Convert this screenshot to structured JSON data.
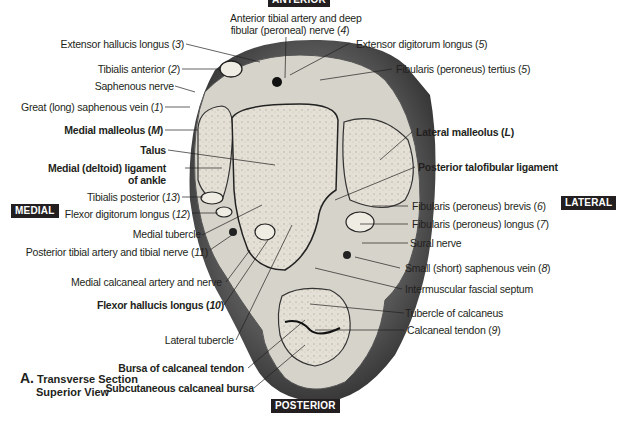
{
  "figure": {
    "caption_letter": "A.",
    "caption_line1": "Transverse Section",
    "caption_line2": "Superior View"
  },
  "orientation_tags": {
    "top": "ANTERIOR",
    "left": "MEDIAL",
    "right": "LATERAL",
    "bottom": "POSTERIOR"
  },
  "labels_left": [
    {
      "text": "Extensor hallucis longus",
      "num": "3",
      "bold": false
    },
    {
      "text": "Tibialis anterior",
      "num": "2",
      "bold": false
    },
    {
      "text": "Saphenous nerve",
      "num": "",
      "bold": false
    },
    {
      "text": "Great (long) saphenous vein",
      "num": "1",
      "bold": false
    },
    {
      "text": "Medial malleolus",
      "num": "M",
      "bold": true
    },
    {
      "text": "Talus",
      "num": "",
      "bold": true
    },
    {
      "text": "Medial (deltoid) ligament",
      "num": "",
      "bold": true
    },
    {
      "text": "of ankle",
      "num": "",
      "bold": true
    },
    {
      "text": "Tibialis posterior",
      "num": "13",
      "bold": false
    },
    {
      "text": "Flexor digitorum longus",
      "num": "12",
      "bold": false
    },
    {
      "text": "Medial tubercle",
      "num": "",
      "bold": false
    },
    {
      "text": "Posterior tibial artery and tibial nerve",
      "num": "11",
      "bold": false
    },
    {
      "text": "Medial calcaneal artery and nerve",
      "num": "",
      "bold": false
    },
    {
      "text": "Flexor hallucis longus",
      "num": "10",
      "bold": true
    },
    {
      "text": "Lateral tubercle",
      "num": "",
      "bold": false
    },
    {
      "text": "Bursa of calcaneal tendon",
      "num": "",
      "bold": true
    },
    {
      "text": "Subcutaneous calcaneal bursa",
      "num": "",
      "bold": true
    }
  ],
  "labels_top": [
    {
      "text": "Anterior tibial artery and deep",
      "num": "",
      "bold": false
    },
    {
      "text": "fibular (peroneal) nerve",
      "num": "4",
      "bold": false
    }
  ],
  "labels_right": [
    {
      "text": "Extensor digitorum longus",
      "num": "5",
      "bold": false
    },
    {
      "text": "Fibularis (peroneus) tertius",
      "num": "5",
      "bold": false
    },
    {
      "text": "Lateral malleolus",
      "num": "L",
      "bold": true
    },
    {
      "text": "Posterior talofibular ligament",
      "num": "",
      "bold": true
    },
    {
      "text": "Fibularis (peroneus) brevis",
      "num": "6",
      "bold": false
    },
    {
      "text": "Fibularis (peroneus) longus",
      "num": "7",
      "bold": false
    },
    {
      "text": "Sural nerve",
      "num": "",
      "bold": false
    },
    {
      "text": "Small (short) saphenous vein",
      "num": "8",
      "bold": false
    },
    {
      "text": "Intermuscular fascial septum",
      "num": "",
      "bold": false
    },
    {
      "text": "Tubercle of calcaneus",
      "num": "",
      "bold": false
    },
    {
      "text": "Calcaneal tendon",
      "num": "9",
      "bold": false
    }
  ],
  "colors": {
    "skin_dark": "#4a4a4a",
    "bone": "#e6e2d8",
    "tissue": "#d2cfc6",
    "text": "#231f20",
    "tag_bg": "#231f20"
  }
}
